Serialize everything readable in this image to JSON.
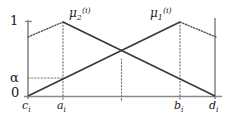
{
  "figure": {
    "name": "fuzzy-membership-functions-diagram",
    "background_color": "#ffffff",
    "line_color_solid": "#3a3a3a",
    "line_color_axis": "#8a8a8a",
    "line_color_guide": "#707070"
  },
  "y_axis": {
    "labels": {
      "top": "1",
      "alpha": "α",
      "zero": "0"
    }
  },
  "x_axis": {
    "ticks": [
      {
        "id": "c",
        "base": "c",
        "sub": "i"
      },
      {
        "id": "a",
        "base": "a",
        "sub": "i"
      },
      {
        "id": "b",
        "base": "b",
        "sub": "i"
      },
      {
        "id": "d",
        "base": "d",
        "sub": "i"
      }
    ]
  },
  "curves": [
    {
      "id": "mu2",
      "label_base": "μ",
      "label_sub": "2",
      "label_sup": "(i)",
      "description": "decreasing-membership-function",
      "peak_tick": "a",
      "solid_path": "M 28 96 L 63 22 L 215 96",
      "dotted_segments": [
        "M 28 37 L 63 22"
      ]
    },
    {
      "id": "mu1",
      "label_base": "μ",
      "label_sub": "1",
      "label_sup": "(i)",
      "description": "increasing-membership-function",
      "peak_tick": "b",
      "solid_path": "M 28 96 L 180 22 L 215 96",
      "dotted_segments": [
        "M 180 22 L 215 37"
      ]
    }
  ],
  "guides": {
    "vertical": [
      {
        "id": "a-guide",
        "x": 63,
        "y_top": 22,
        "y_bottom": 99
      },
      {
        "id": "center-guide",
        "x": 121.5,
        "y_top": 59,
        "y_bottom": 99
      },
      {
        "id": "b-guide",
        "x": 180,
        "y_top": 22,
        "y_bottom": 99
      }
    ],
    "horizontal": [
      {
        "id": "alpha-guide",
        "y": 78,
        "x_left": 28,
        "x_right": 63
      }
    ]
  },
  "geometry": {
    "y_axis_x": 28,
    "x_axis_y": 96,
    "x_axis_left": 24,
    "x_axis_right": 222,
    "y_axis_top": 20,
    "d_axis_x": 215,
    "d_axis_top": 18,
    "one_level_y": 22,
    "alpha_level_y": 78,
    "tick_a_x": 63,
    "tick_b_x": 180,
    "tick_c_x": 28,
    "tick_d_x": 215
  }
}
